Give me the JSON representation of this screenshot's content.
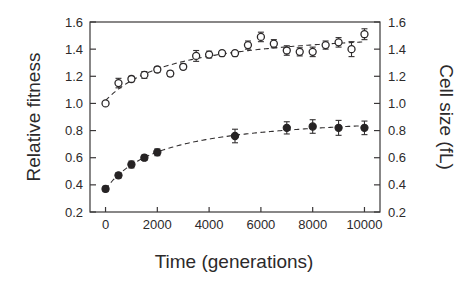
{
  "chart_data": {
    "type": "scatter",
    "title": "",
    "xlabel": "Time (generations)",
    "ylabel": "Relative fitness",
    "y2label": "Cell size (fL)",
    "xlim": [
      -600,
      10600
    ],
    "ylim": [
      0.2,
      1.6
    ],
    "y2lim": [
      0.2,
      1.6
    ],
    "xticks": [
      0,
      2000,
      4000,
      6000,
      8000,
      10000
    ],
    "xticklabels": [
      "0",
      "2000",
      "4000",
      "6000",
      "8000",
      "10000"
    ],
    "yticks": [
      0.2,
      0.4,
      0.6,
      0.8,
      1.0,
      1.2,
      1.4,
      1.6
    ],
    "yticklabels": [
      "0.2",
      "0.4",
      "0.6",
      "0.8",
      "1.0",
      "1.2",
      "1.4",
      "1.6"
    ],
    "y2ticks": [
      0.2,
      0.4,
      0.6,
      0.8,
      1.0,
      1.2,
      1.4,
      1.6
    ],
    "y2ticklabels": [
      "0.2",
      "0.4",
      "0.6",
      "0.8",
      "1.0",
      "1.2",
      "1.4",
      "1.6"
    ],
    "grid": false,
    "legend": "none",
    "series": [
      {
        "name": "Relative fitness",
        "marker": "open-circle",
        "axis": "left",
        "fit": "dashed-hyperbolic",
        "x": [
          0,
          500,
          1000,
          1500,
          2000,
          2500,
          3000,
          3500,
          4000,
          4500,
          5000,
          5500,
          6000,
          6500,
          7000,
          7500,
          8000,
          8500,
          9000,
          9500,
          10000
        ],
        "y": [
          1.0,
          1.15,
          1.18,
          1.21,
          1.25,
          1.22,
          1.27,
          1.35,
          1.36,
          1.37,
          1.37,
          1.43,
          1.49,
          1.44,
          1.39,
          1.38,
          1.38,
          1.43,
          1.45,
          1.4,
          1.51
        ],
        "yerr": [
          0.0,
          0.035,
          0.02,
          0.025,
          0.02,
          0.02,
          0.02,
          0.04,
          0.025,
          0.02,
          0.02,
          0.03,
          0.035,
          0.03,
          0.035,
          0.03,
          0.035,
          0.03,
          0.035,
          0.055,
          0.04
        ]
      },
      {
        "name": "Cell size",
        "marker": "filled-circle",
        "axis": "right",
        "fit": "dashed-hyperbolic",
        "x": [
          0,
          500,
          1000,
          1500,
          2000,
          5000,
          7000,
          8000,
          9000,
          10000
        ],
        "y": [
          0.37,
          0.47,
          0.55,
          0.6,
          0.64,
          0.76,
          0.82,
          0.83,
          0.82,
          0.82
        ],
        "yerr": [
          0.02,
          0.02,
          0.025,
          0.02,
          0.025,
          0.05,
          0.045,
          0.05,
          0.055,
          0.05
        ]
      }
    ]
  }
}
